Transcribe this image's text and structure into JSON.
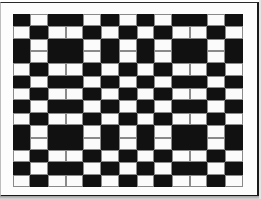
{
  "image": {
    "description": "Black and white woven check pattern inside a framed box",
    "grid": {
      "columns": 13,
      "rows": 14,
      "legend": {
        "B": "black",
        "W": "white"
      },
      "row_patterns": {
        "P": [
          "B",
          "W",
          "B",
          "B",
          "W",
          "B",
          "W",
          "B",
          "W",
          "B",
          "B",
          "W",
          "B"
        ],
        "Q": [
          "W",
          "B",
          "W",
          "W",
          "B",
          "W",
          "B",
          "W",
          "B",
          "W",
          "W",
          "B",
          "W"
        ]
      },
      "row_sequence": [
        "P",
        "Q",
        "P",
        "P",
        "Q",
        "P",
        "Q",
        "P",
        "Q",
        "P",
        "P",
        "Q",
        "P",
        "Q"
      ]
    },
    "colors": {
      "black": "#111111",
      "white": "#fbfbfb",
      "separator": "#8a8a8a",
      "frame": "#1a1a1a"
    }
  }
}
